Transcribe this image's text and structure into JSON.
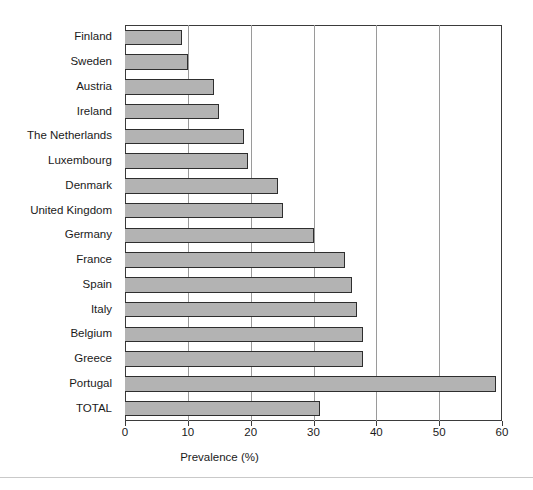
{
  "chart_data": {
    "type": "bar",
    "orientation": "horizontal",
    "title": "",
    "xlabel": "Prevalence (%)",
    "ylabel": "",
    "xlim": [
      0,
      60
    ],
    "xticks": [
      0,
      10,
      20,
      30,
      40,
      50,
      60
    ],
    "xtick_labels": [
      "0",
      "10",
      "20",
      "30",
      "40",
      "50",
      "60"
    ],
    "grid": "vertical",
    "legend": "none",
    "bar_fill_color": "#b3b3b3",
    "bar_edge_color": "#2e2e2e",
    "categories": [
      "Finland",
      "Sweden",
      "Austria",
      "Ireland",
      "The Netherlands",
      "Luxembourg",
      "Denmark",
      "United Kingdom",
      "Germany",
      "France",
      "Spain",
      "Italy",
      "Belgium",
      "Greece",
      "Portugal",
      "TOTAL"
    ],
    "values": [
      9.1,
      10.0,
      14.2,
      15.0,
      19.0,
      19.6,
      24.4,
      25.2,
      30.0,
      35.0,
      36.2,
      37.0,
      37.8,
      37.8,
      59.0,
      31.0
    ]
  }
}
